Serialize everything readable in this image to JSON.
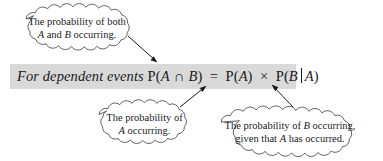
{
  "figure": {
    "background_color": "#ffffff",
    "band_color": "#d9d9d9",
    "ink_color": "#1a1a1a"
  },
  "formula": {
    "lead_in": "For dependent events",
    "left_side": "P(A ∩ B)",
    "equals": "=",
    "prob_a": "P(A)",
    "times": "×",
    "cond_open": "P(B",
    "cond_bar": "|",
    "cond_close": "A)",
    "full_text": "For dependent events P(A ∩ B) = P(A) × P(B | A)",
    "parts": {
      "p_open": "P(",
      "var_a": "A",
      "intersection": "∩",
      "var_b": "B",
      "close_paren": ")"
    }
  },
  "callouts": [
    {
      "id": "both",
      "line1": "The probability of both",
      "line2_pre": "",
      "line2_var1": "A",
      "line2_mid": " and ",
      "line2_var2": "B",
      "line2_post": " occurring.",
      "line2_plain": "A and B occurring.",
      "points_to": "P(A ∩ B)"
    },
    {
      "id": "prob-a",
      "line1": "The probability of",
      "line2_var1": "A",
      "line2_post": " occurring.",
      "line2_plain": "A occurring.",
      "points_to": "P(A)"
    },
    {
      "id": "prob-b-given-a",
      "line1_pre": "The probability of ",
      "line1_var": "B",
      "line1_post": " occurring,",
      "line1_plain": "The probability of B occurring,",
      "line2_pre": "given that ",
      "line2_var": "A",
      "line2_post": " has occurred.",
      "line2_plain": "given that A has occurred.",
      "points_to": "| (conditional bar)"
    }
  ]
}
